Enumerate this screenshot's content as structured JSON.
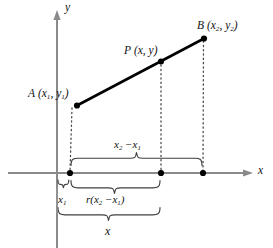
{
  "figure": {
    "type": "coordinate-geometry-diagram",
    "background_color": "#ffffff",
    "line_color": "#000000",
    "axis_color": "#808080",
    "dotted_color": "#555555",
    "brace_color": "#4d4d4d"
  },
  "axes": {
    "x_label": "x",
    "y_label": "y",
    "x_axis_y_px": 173,
    "y_axis_x_px": 57
  },
  "points": [
    {
      "id": "A",
      "name": "point-a",
      "label_letter": "A",
      "label_coords": "(x1, y1)",
      "x_px": 77,
      "y_px": 105
    },
    {
      "id": "P",
      "name": "point-p",
      "label_letter": "P",
      "label_coords": "(x, y)",
      "x_px": 161,
      "y_px": 62
    },
    {
      "id": "B",
      "name": "point-b",
      "label_letter": "B",
      "label_coords": "(x2, y2)",
      "x_px": 204,
      "y_px": 38
    }
  ],
  "foot_points": [
    {
      "name": "foot-a",
      "x_px": 70,
      "y_px": 173
    },
    {
      "name": "foot-p",
      "x_px": 161,
      "y_px": 173
    },
    {
      "name": "foot-b",
      "x_px": 203,
      "y_px": 173
    }
  ],
  "labels": {
    "point_a": {
      "letter": "A",
      "open": "(",
      "x_var": "x",
      "x_sub": "1",
      "comma": ", ",
      "y_var": "y",
      "y_sub": "1",
      "close": ")"
    },
    "point_p": {
      "letter": "P",
      "open": "(",
      "x_var": "x",
      "comma": ", ",
      "y_var": "y",
      "close": ")"
    },
    "point_b": {
      "letter": "B",
      "open": "(",
      "x_var": "x",
      "x_sub": "2",
      "comma": ", ",
      "y_var": "y",
      "y_sub": "2",
      "close": ")"
    },
    "axis_x": "x",
    "axis_y": "y"
  },
  "braces": [
    {
      "name": "brace-x2-minus-x1",
      "position": "above-axis",
      "from_px": 70,
      "to_px": 203,
      "label_plain": "x2 − x1",
      "parts": {
        "x_var": "x",
        "sub_2": "2",
        "minus": " −",
        "x_var2": "x",
        "sub_1": "1"
      }
    },
    {
      "name": "brace-r-times-x2-minus-x1",
      "position": "below-axis",
      "from_px": 70,
      "to_px": 161,
      "label_plain": "r(x2 − x1)",
      "parts": {
        "r": "r",
        "open": "(",
        "x_var": "x",
        "sub_2": "2",
        "minus": " −",
        "x_var2": "x",
        "sub_1": "1",
        "close": ")"
      }
    },
    {
      "name": "brace-x1",
      "position": "below-axis-small",
      "from_px": 57,
      "to_px": 70,
      "label_plain": "x1",
      "parts": {
        "x_var": "x",
        "sub": "1"
      }
    },
    {
      "name": "brace-x",
      "position": "bottom",
      "from_px": 57,
      "to_px": 161,
      "label_plain": "x",
      "parts": {
        "x_var": "x"
      }
    }
  ]
}
